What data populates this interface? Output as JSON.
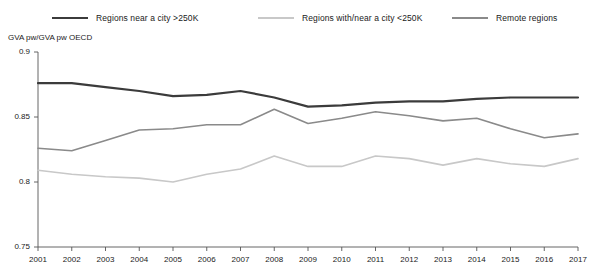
{
  "legend": {
    "position": "top",
    "items": [
      {
        "label": "Regions near a city >250K",
        "color": "#3b3b3b",
        "icon": "line-swatch-icon"
      },
      {
        "label": "Regions with/near a city <250K",
        "color": "#c8c8c8",
        "icon": "line-swatch-icon"
      },
      {
        "label": "Remote regions",
        "color": "#8a8a8a",
        "icon": "line-swatch-icon"
      }
    ]
  },
  "axis": {
    "y_title": "GVA pw/GVA pw OECD",
    "y_ticks": [
      "0.9",
      "0.85",
      "0.8",
      "0.75"
    ],
    "x_ticks": [
      "2001",
      "2002",
      "2003",
      "2004",
      "2005",
      "2006",
      "2007",
      "2008",
      "2009",
      "2010",
      "2011",
      "2012",
      "2013",
      "2014",
      "2015",
      "2016",
      "2017"
    ]
  },
  "chart_data": {
    "type": "line",
    "title": "",
    "xlabel": "",
    "ylabel": "GVA pw/GVA pw OECD",
    "grid": false,
    "legend_position": "top",
    "ylim": [
      0.75,
      0.9
    ],
    "yticks": [
      0.75,
      0.8,
      0.85,
      0.9
    ],
    "categories": [
      2001,
      2002,
      2003,
      2004,
      2005,
      2006,
      2007,
      2008,
      2009,
      2010,
      2011,
      2012,
      2013,
      2014,
      2015,
      2016,
      2017
    ],
    "x": [
      2001,
      2002,
      2003,
      2004,
      2005,
      2006,
      2007,
      2008,
      2009,
      2010,
      2011,
      2012,
      2013,
      2014,
      2015,
      2016,
      2017
    ],
    "series": [
      {
        "name": "Regions near a city >250K",
        "color": "#3b3b3b",
        "values": [
          0.876,
          0.876,
          0.873,
          0.87,
          0.866,
          0.867,
          0.87,
          0.865,
          0.858,
          0.859,
          0.861,
          0.862,
          0.862,
          0.864,
          0.865,
          0.865,
          0.865
        ]
      },
      {
        "name": "Regions with/near a city <250K",
        "color": "#c8c8c8",
        "values": [
          0.809,
          0.806,
          0.804,
          0.803,
          0.8,
          0.806,
          0.81,
          0.82,
          0.812,
          0.812,
          0.82,
          0.818,
          0.813,
          0.818,
          0.814,
          0.812,
          0.818
        ]
      },
      {
        "name": "Remote regions",
        "color": "#8a8a8a",
        "values": [
          0.826,
          0.824,
          0.832,
          0.84,
          0.841,
          0.844,
          0.844,
          0.856,
          0.845,
          0.849,
          0.854,
          0.851,
          0.847,
          0.849,
          0.841,
          0.834,
          0.837
        ]
      }
    ]
  },
  "geometry": {
    "plot_left": 38,
    "plot_right": 578,
    "plot_top": 52,
    "plot_bottom": 247
  }
}
